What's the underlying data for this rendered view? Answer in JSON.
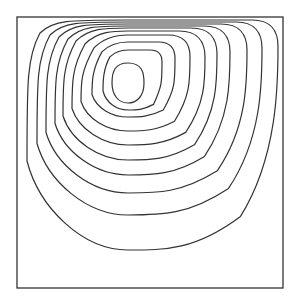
{
  "chart_data": {
    "type": "contour",
    "title": "",
    "xlabel": "",
    "ylabel": "",
    "grid": false,
    "legend": null,
    "frame": {
      "x0": 17,
      "y0": 17,
      "x1": 283,
      "y1": 288,
      "stroke": "#333333"
    },
    "line_color": "#333333",
    "vortex_center_px": [
      128,
      82
    ],
    "n_contours": 10,
    "contours": [
      {
        "level": 1,
        "left": 27,
        "right": 278,
        "top": 20,
        "bottom": 250
      },
      {
        "level": 2,
        "left": 37,
        "right": 262,
        "top": 22,
        "bottom": 215
      },
      {
        "level": 3,
        "left": 46,
        "right": 247,
        "top": 24,
        "bottom": 193
      },
      {
        "level": 4,
        "left": 55,
        "right": 230,
        "top": 26,
        "bottom": 175
      },
      {
        "level": 5,
        "left": 63,
        "right": 217,
        "top": 28,
        "bottom": 160
      },
      {
        "level": 6,
        "left": 72,
        "right": 205,
        "top": 31,
        "bottom": 145
      },
      {
        "level": 7,
        "left": 81,
        "right": 190,
        "top": 35,
        "bottom": 131
      },
      {
        "level": 8,
        "left": 92,
        "right": 175,
        "top": 42,
        "bottom": 117
      },
      {
        "level": 9,
        "left": 103,
        "right": 162,
        "top": 50,
        "bottom": 110
      },
      {
        "level": 10,
        "left": 112,
        "right": 144,
        "top": 63,
        "bottom": 103
      }
    ]
  }
}
